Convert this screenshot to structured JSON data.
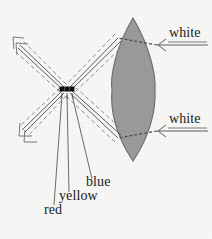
{
  "figure": {
    "background_color": "#f6f6f4",
    "width": 212,
    "height": 239
  },
  "lens": {
    "name": "biconvex-lens",
    "fill_color": "#9a9a9a",
    "stroke_color": "#6f6f6f",
    "top_tip_x": 133,
    "top_tip_y": 18,
    "bottom_tip_x": 133,
    "bottom_tip_y": 161,
    "left_edge_x": 112,
    "right_edge_x": 155
  },
  "focus_point": {
    "name": "convergence-point",
    "x": 67,
    "y": 90,
    "dot_color": "#101010",
    "dot_count": 3,
    "dot_positions_x": [
      62,
      67,
      72
    ],
    "dot_y": 90
  },
  "incoming_beams": [
    {
      "id": "upper-white-beam",
      "label": "white",
      "label_x": 169,
      "label_y": 27,
      "arrow_tail_x": 208,
      "arrow_tail_y": 45,
      "arrow_head_x": 155,
      "arrow_head_y": 45
    },
    {
      "id": "lower-white-beam",
      "label": "white",
      "label_x": 169,
      "label_y": 114,
      "arrow_tail_x": 208,
      "arrow_tail_y": 131,
      "arrow_head_x": 155,
      "arrow_head_y": 131
    }
  ],
  "outgoing_labels": [
    {
      "id": "blue-label",
      "label": "blue",
      "color_name": "blue",
      "x": 86,
      "y": 183
    },
    {
      "id": "yellow-label",
      "label": "yellow",
      "color_name": "yellow",
      "x": 59,
      "y": 196
    },
    {
      "id": "red-label",
      "label": "red",
      "color_name": "red",
      "x": 44,
      "y": 210
    }
  ],
  "exit_arrows": [
    {
      "id": "upper-left-arrow",
      "head_x": 16,
      "head_y": 43,
      "direction": "up-left"
    },
    {
      "id": "lower-left-arrow",
      "head_x": 20,
      "head_y": 137,
      "direction": "down-left"
    }
  ],
  "line_style": {
    "solid_color": "#5d5d5d",
    "dashed_color": "#8d8d8d",
    "leader_color": "#595959",
    "solid_width": 1,
    "dash_pattern": "4 3"
  }
}
